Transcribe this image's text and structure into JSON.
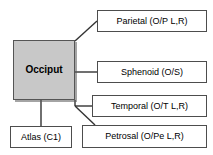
{
  "diagram": {
    "type": "node-link-hierarchy",
    "center": {
      "id": "occiput",
      "label": "Occiput",
      "fill_color": "#c8c8c8",
      "border_color": "#555555"
    },
    "nodes": [
      {
        "id": "parietal",
        "label": "Parietal (O/P L,R)",
        "connector": "diagonal",
        "from": "center-top-right"
      },
      {
        "id": "sphenoid",
        "label": "Sphenoid (O/S)",
        "connector": "horizontal",
        "from": "center-right"
      },
      {
        "id": "temporal",
        "label": "Temporal (O/T L,R)",
        "connector": "horizontal",
        "from": "center-bottom-right"
      },
      {
        "id": "petrosal",
        "label": "Petrosal (O/Pe L,R)",
        "connector": "diagonal",
        "from": "center-bottom-right"
      },
      {
        "id": "atlas",
        "label": "Atlas (C1)",
        "connector": "vertical",
        "from": "center-bottom"
      }
    ],
    "line_color": "#333333",
    "background_color": "#ffffff"
  }
}
